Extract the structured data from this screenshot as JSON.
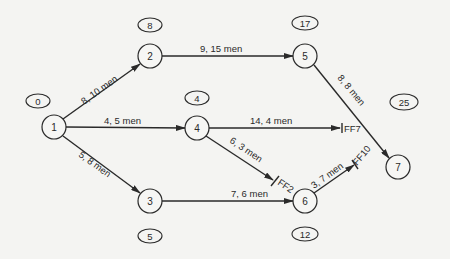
{
  "diagram": {
    "type": "precedence network (activity-on-arrow with free float)",
    "colors": {
      "background": "#f4f4f2",
      "ink": "#2a2a2a"
    },
    "nodes": [
      {
        "id": "1",
        "label": "1",
        "x": 54,
        "y": 127,
        "time": "0",
        "time_x": 38,
        "time_y": 101
      },
      {
        "id": "2",
        "label": "2",
        "x": 150,
        "y": 56,
        "time": "8",
        "time_x": 150,
        "time_y": 25
      },
      {
        "id": "3",
        "label": "3",
        "x": 150,
        "y": 201,
        "time": "5",
        "time_x": 150,
        "time_y": 236
      },
      {
        "id": "4",
        "label": "4",
        "x": 197,
        "y": 128,
        "time": "4",
        "time_x": 197,
        "time_y": 98
      },
      {
        "id": "5",
        "label": "5",
        "x": 305,
        "y": 56,
        "time": "17",
        "time_x": 305,
        "time_y": 23
      },
      {
        "id": "6",
        "label": "6",
        "x": 305,
        "y": 201,
        "time": "12",
        "time_x": 305,
        "time_y": 234
      },
      {
        "id": "7",
        "label": "7",
        "x": 398,
        "y": 167,
        "time": "25",
        "time_x": 404,
        "time_y": 102
      }
    ],
    "activities": [
      {
        "from": "1",
        "to": "2",
        "label": "8, 10 men"
      },
      {
        "from": "1",
        "to": "4",
        "label": "4, 5 men"
      },
      {
        "from": "1",
        "to": "3",
        "label": "5, 8 men"
      },
      {
        "from": "2",
        "to": "5",
        "label": "9, 15 men"
      },
      {
        "from": "5",
        "to": "7",
        "label": "8, 8 men"
      },
      {
        "from": "4",
        "to": "FF7",
        "label": "14, 4 men",
        "free_float": "FF7"
      },
      {
        "from": "4",
        "to": "FF2",
        "label": "6, 3 men",
        "free_float": "FF2"
      },
      {
        "from": "3",
        "to": "6",
        "label": "7, 6 men"
      },
      {
        "from": "6",
        "to": "FF10",
        "label": "3, 7 men",
        "free_float": "FF10"
      }
    ]
  }
}
